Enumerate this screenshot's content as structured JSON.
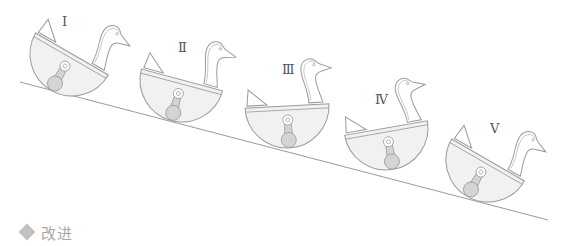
{
  "figure": {
    "colors": {
      "outline": "#9a9a9a",
      "body_fill": "#f1f1f1",
      "weight_fill": "#d4d4d4",
      "incline_line": "#9a9a9a"
    },
    "incline": {
      "x1": 20,
      "y1": 82,
      "x2": 548,
      "y2": 220
    },
    "ducks": [
      {
        "label": "Ⅰ",
        "label_x": 48,
        "label_y": 24
      },
      {
        "label": "Ⅱ",
        "label_x": 178,
        "label_y": 52
      },
      {
        "label": "Ⅲ",
        "label_x": 282,
        "label_y": 73
      },
      {
        "label": "Ⅳ",
        "label_x": 384,
        "label_y": 104
      },
      {
        "label": "Ⅴ",
        "label_x": 492,
        "label_y": 133
      }
    ]
  },
  "section": {
    "icon": "diamond-icon",
    "title": "改进"
  }
}
